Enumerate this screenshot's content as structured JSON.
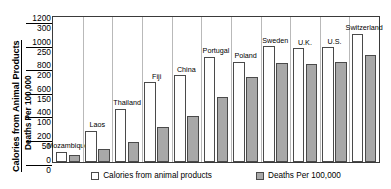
{
  "chart_data": {
    "type": "bar",
    "title": "",
    "xlabel": "",
    "ylabel_primary": "Calories from Animal Products",
    "ylabel_secondary": "Deaths Per 100,000",
    "grid": false,
    "legend_position": "bottom",
    "categories": [
      "Mozambique",
      "Laos",
      "Thailand",
      "Fiji",
      "China",
      "Portugal",
      "Poland",
      "Sweden",
      "U.K.",
      "U.S.",
      "Switzerland"
    ],
    "series": [
      {
        "name": "Calories from animal products",
        "color": "#ffffff",
        "axis": "primary",
        "ylim": [
          0,
          1200
        ],
        "values": [
          85,
          260,
          440,
          660,
          720,
          870,
          830,
          960,
          940,
          950,
          1060
        ]
      },
      {
        "name": "Deaths Per 100,000",
        "color": "#a8a8a8",
        "axis": "secondary",
        "ylim": [
          0,
          300
        ],
        "values": [
          14,
          26,
          42,
          72,
          95,
          135,
          175,
          205,
          203,
          208,
          222
        ]
      }
    ],
    "yticks_primary": [
      "1200",
      "1000",
      "800",
      "600",
      "400",
      "200",
      "0"
    ],
    "yticks_secondary": [
      "300",
      "250",
      "200",
      "150",
      "100",
      "50",
      "0"
    ]
  },
  "legend": {
    "items": [
      {
        "label": "Calories from animal products",
        "swatch": "white"
      },
      {
        "label": "Deaths Per 100,000",
        "swatch": "gray"
      }
    ]
  }
}
